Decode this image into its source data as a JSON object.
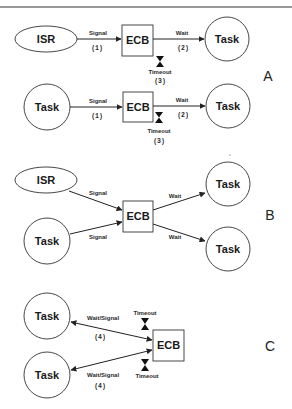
{
  "figure": {
    "panels": [
      {
        "label": "A",
        "rows": [
          {
            "source": "ISR",
            "ecb": "ECB",
            "target": "Task",
            "signal_label": "Signal",
            "signal_num": "(1)",
            "wait_label": "Wait",
            "wait_num": "(2)",
            "timeout_label": "Timeout",
            "timeout_num": "(3)"
          },
          {
            "source": "Task",
            "ecb": "ECB",
            "target": "Task",
            "signal_label": "Signal",
            "signal_num": "(1)",
            "wait_label": "Wait",
            "wait_num": "(2)",
            "timeout_label": "Timeout",
            "timeout_num": "(3)"
          }
        ]
      },
      {
        "label": "B",
        "sources": [
          "ISR",
          "Task"
        ],
        "ecb": "ECB",
        "targets": [
          "Task",
          "Task"
        ],
        "signal_labels": [
          "Signal",
          "Signal"
        ],
        "wait_labels": [
          "Wait",
          "Wait"
        ]
      },
      {
        "label": "C",
        "tasks": [
          "Task",
          "Task"
        ],
        "ecb": "ECB",
        "edge_labels": [
          "Wait/Signal",
          "Wait/Signal"
        ],
        "edge_nums": [
          "(4)",
          "(4)"
        ],
        "timeout_labels": [
          "Timeout",
          "Timeout"
        ]
      }
    ],
    "colors": {
      "stroke": "#333333",
      "background": "#ffffff"
    }
  }
}
